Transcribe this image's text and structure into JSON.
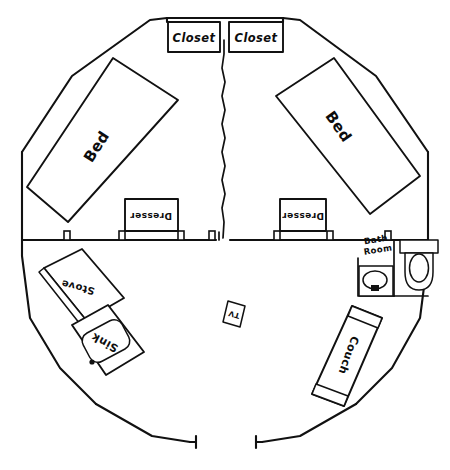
{
  "drawing": {
    "title": "Hand-drawn octagonal floor plan",
    "style": "pencil sketch",
    "ink_color": "#111111",
    "paper_color": "#ffffff"
  },
  "rooms": {
    "bedroom_left": {
      "name": "Left Bedroom"
    },
    "bedroom_right": {
      "name": "Right Bedroom"
    },
    "bathroom": {
      "label_line1": "Bath",
      "label_line2": "Room"
    },
    "living": {
      "name": "Living Area"
    }
  },
  "labels": {
    "closet_left": "Closet",
    "closet_right": "Closet",
    "bed_left": "Bed",
    "bed_right": "Bed",
    "dresser_left": "Dresser",
    "dresser_right": "Dresser",
    "stove": "Stove",
    "sink_kitchen": "Sink",
    "couch": "Couch",
    "tv": "TV"
  },
  "fixtures": {
    "toilet": "toilet",
    "bath_sink": "bathroom-sink",
    "entry_door": "entry-doorway"
  },
  "geometry": {
    "outline_points": "218,18 144,22 70,74 22,152 22,240 32,318 92,400 150,438 218,452 300,438 360,400 418,318 428,240 428,152 372,74 300,22 218,18",
    "inner_wall_horizontal_left": "M 22,240 L 216,240",
    "inner_wall_horizontal_right": "M 228,240 L 428,240",
    "divider_wavy": "M 224,40 L 224,60 L 222,82 L 225,104 L 222,126 L 225,148 L 222,170 L 225,192 L 222,214 L 224,236",
    "bath_wall_left": "M 358,258 L 358,296",
    "bath_wall_bottom": "M 358,296 L 428,296"
  }
}
